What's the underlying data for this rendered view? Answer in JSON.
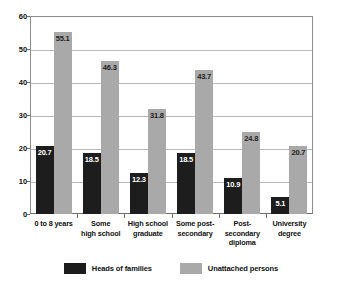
{
  "chart_data": {
    "type": "bar",
    "title": "",
    "xlabel": "",
    "ylabel": "",
    "ylim": [
      0,
      60
    ],
    "yticks": [
      0,
      10,
      20,
      30,
      40,
      50,
      60
    ],
    "grid": true,
    "legend_position": "bottom",
    "categories": [
      "0 to 8 years",
      "Some high school",
      "High school graduate",
      "Some post-secondary",
      "Post-secondary diploma",
      "University degree"
    ],
    "category_lines": [
      [
        "0 to 8 years"
      ],
      [
        "Some",
        "high school"
      ],
      [
        "High school",
        "graduate"
      ],
      [
        "Some post-",
        "secondary"
      ],
      [
        "Post-secondary",
        "diploma"
      ],
      [
        "University",
        "degree"
      ]
    ],
    "series": [
      {
        "name": "Heads of families",
        "color": "#1d1d1d",
        "values": [
          20.7,
          18.5,
          12.3,
          18.5,
          10.9,
          5.1
        ]
      },
      {
        "name": "Unattached persons",
        "color": "#a9a9a9",
        "values": [
          55.1,
          46.3,
          31.8,
          43.7,
          24.8,
          20.7
        ]
      }
    ]
  }
}
